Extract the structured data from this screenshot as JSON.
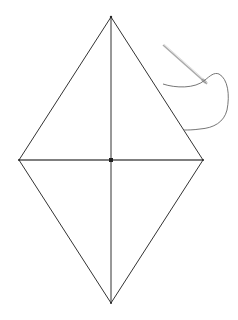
{
  "diagram": {
    "stroke_color": "#333333",
    "needle_color": "#999999",
    "thread_color": "#666666",
    "vertices": {
      "top": [
        111,
        17
      ],
      "left": [
        19,
        160
      ],
      "right": [
        203,
        160
      ],
      "bottom": [
        111,
        303
      ]
    },
    "center": [
      111,
      160
    ],
    "icons": [
      "needle-icon",
      "thread-icon"
    ]
  }
}
